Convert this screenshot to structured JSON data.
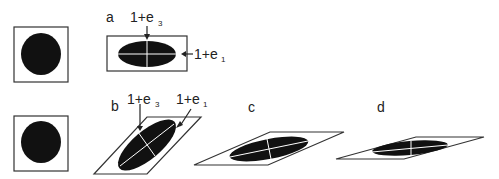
{
  "panels": {
    "a": {
      "label": "a",
      "axis_short": "1+e",
      "axis_short_sub": "3",
      "axis_long": "1+e",
      "axis_long_sub": "1"
    },
    "b": {
      "label": "b",
      "axis_short": "1+e",
      "axis_short_sub": "3",
      "axis_long": "1+e",
      "axis_long_sub": "1"
    },
    "c": {
      "label": "c"
    },
    "d": {
      "label": "d"
    }
  },
  "colors": {
    "stroke": "#333333",
    "fill": "#111111",
    "axis": "#ffffff"
  }
}
